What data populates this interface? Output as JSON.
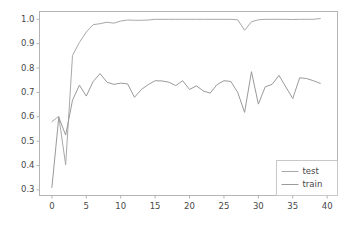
{
  "chart_data": {
    "type": "line",
    "title": "",
    "xlabel": "",
    "ylabel": "",
    "xlim": [
      -1.8,
      41.5
    ],
    "ylim": [
      0.277,
      1.032
    ],
    "grid": false,
    "legend_position": "lower right",
    "xticks": [
      "0",
      "5",
      "10",
      "15",
      "20",
      "25",
      "30",
      "35",
      "40"
    ],
    "xtick_values": [
      0,
      5,
      10,
      15,
      20,
      25,
      30,
      35,
      40
    ],
    "yticks": [
      "0.3",
      "0.4",
      "0.5",
      "0.6",
      "0.7",
      "0.8",
      "0.9",
      "1.0"
    ],
    "ytick_values": [
      0.3,
      0.4,
      0.5,
      0.6,
      0.7,
      0.8,
      0.9,
      1.0
    ],
    "x": [
      0,
      1,
      2,
      3,
      4,
      5,
      6,
      7,
      8,
      9,
      10,
      11,
      12,
      13,
      14,
      15,
      16,
      17,
      18,
      19,
      20,
      21,
      22,
      23,
      24,
      25,
      26,
      27,
      28,
      29,
      30,
      31,
      32,
      33,
      34,
      35,
      36,
      37,
      38,
      39
    ],
    "series": [
      {
        "name": "test",
        "color": "#a8a8a8",
        "values": [
          0.58,
          0.602,
          0.403,
          0.852,
          0.905,
          0.948,
          0.978,
          0.982,
          0.988,
          0.984,
          0.993,
          0.997,
          0.996,
          0.996,
          0.997,
          1.0,
          1.0,
          1.0,
          1.0,
          1.0,
          1.0,
          1.0,
          1.0,
          1.0,
          1.0,
          1.0,
          1.0,
          0.998,
          0.955,
          0.99,
          0.998,
          1.0,
          1.0,
          1.0,
          1.0,
          0.999,
          1.0,
          1.0,
          1.0,
          1.003
        ]
      },
      {
        "name": "train",
        "color": "#9a9a9a",
        "values": [
          0.31,
          0.598,
          0.525,
          0.668,
          0.73,
          0.685,
          0.745,
          0.777,
          0.742,
          0.733,
          0.738,
          0.735,
          0.68,
          0.712,
          0.732,
          0.748,
          0.747,
          0.742,
          0.728,
          0.748,
          0.712,
          0.727,
          0.706,
          0.697,
          0.732,
          0.748,
          0.745,
          0.7,
          0.618,
          0.785,
          0.652,
          0.723,
          0.733,
          0.77,
          0.722,
          0.675,
          0.76,
          0.757,
          0.748,
          0.737
        ]
      }
    ],
    "legend_entries": [
      {
        "label": "test",
        "color": "#a8a8a8"
      },
      {
        "label": "train",
        "color": "#9a9a9a"
      }
    ],
    "axes_color": "#b4b4b4",
    "legend_border_color": "#c8c8c8",
    "background": "#ffffff"
  }
}
